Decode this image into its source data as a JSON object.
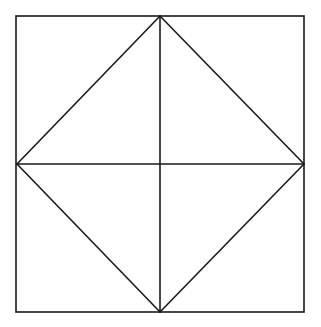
{
  "diagram": {
    "title": "",
    "canvas": {
      "width": 321,
      "height": 327,
      "background": "#ffffff"
    },
    "stroke": {
      "color": "#1a1a1a",
      "width": 1.6
    },
    "outer_square": {
      "x1": 16,
      "y1": 16,
      "x2": 304,
      "y2": 312
    },
    "midpoints": {
      "top": {
        "x": 160,
        "y": 16
      },
      "right": {
        "x": 304,
        "y": 164
      },
      "bottom": {
        "x": 160,
        "y": 312
      },
      "left": {
        "x": 17,
        "y": 164
      }
    },
    "lines": [
      {
        "name": "vertical-midline",
        "from": "top",
        "to": "bottom"
      },
      {
        "name": "horizontal-midline",
        "from": "left",
        "to": "right"
      },
      {
        "name": "diamond-top-left",
        "from": "left",
        "to": "top"
      },
      {
        "name": "diamond-top-right",
        "from": "top",
        "to": "right"
      },
      {
        "name": "diamond-bottom-right",
        "from": "right",
        "to": "bottom"
      },
      {
        "name": "diamond-bottom-left",
        "from": "bottom",
        "to": "left"
      }
    ]
  }
}
